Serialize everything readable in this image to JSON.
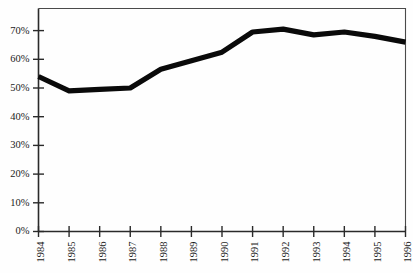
{
  "chart_data": {
    "type": "line",
    "title": "",
    "subtitle": "",
    "xlabel": "",
    "ylabel": "",
    "categories": [
      "1984",
      "1985",
      "1986",
      "1987",
      "1988",
      "1989",
      "1990",
      "1991",
      "1992",
      "1993",
      "1994",
      "1995",
      "1996"
    ],
    "x": [
      1984,
      1985,
      1986,
      1987,
      1988,
      1989,
      1990,
      1991,
      1992,
      1993,
      1994,
      1995,
      1996
    ],
    "values": [
      54,
      49,
      49.5,
      50,
      56.5,
      59.5,
      62.5,
      69.5,
      70.5,
      68.5,
      69.5,
      68,
      66
    ],
    "series": [
      {
        "name": "",
        "values": [
          54,
          49,
          49.5,
          50,
          56.5,
          59.5,
          62.5,
          69.5,
          70.5,
          68.5,
          69.5,
          68,
          66
        ]
      }
    ],
    "ylim": [
      0,
      75
    ],
    "ytick_values": [
      0,
      10,
      20,
      30,
      40,
      50,
      60,
      70
    ],
    "ytick_labels": [
      "0%",
      "10%",
      "20%",
      "30%",
      "40%",
      "50%",
      "60%",
      "70%"
    ],
    "xtick_labels": [
      "1984",
      "1985",
      "1986",
      "1987",
      "1988",
      "1989",
      "1990",
      "1991",
      "1992",
      "1993",
      "1994",
      "1995",
      "1996"
    ],
    "grid": false,
    "legend": null,
    "legend_position": "none",
    "annotations": [],
    "line_color": "#0a0a0a",
    "axis_color": "#2a2a2a",
    "frame_color": "#4a4a4a",
    "background_color": "#fefefe",
    "xtick_label_rotation": -90
  }
}
